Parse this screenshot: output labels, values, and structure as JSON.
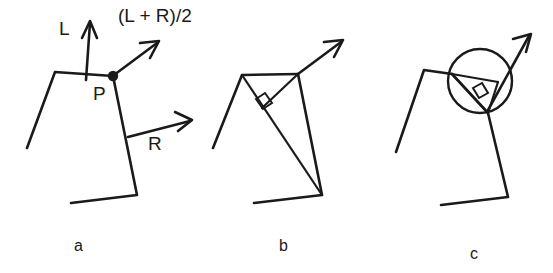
{
  "figure": {
    "background_color": "#ffffff",
    "ink_color": "#1a1a1a",
    "width": 553,
    "height": 273
  },
  "labels": {
    "left_vector": "L",
    "right_vector": "R",
    "point": "P",
    "bisector_expression": "(L + R)/2"
  },
  "panels": [
    {
      "id": "a",
      "caption": "a"
    },
    {
      "id": "b",
      "caption": "b"
    },
    {
      "id": "c",
      "caption": "c"
    }
  ],
  "annotations": {
    "right_angle_marker": "right-angle",
    "circle_marker": "circle"
  }
}
